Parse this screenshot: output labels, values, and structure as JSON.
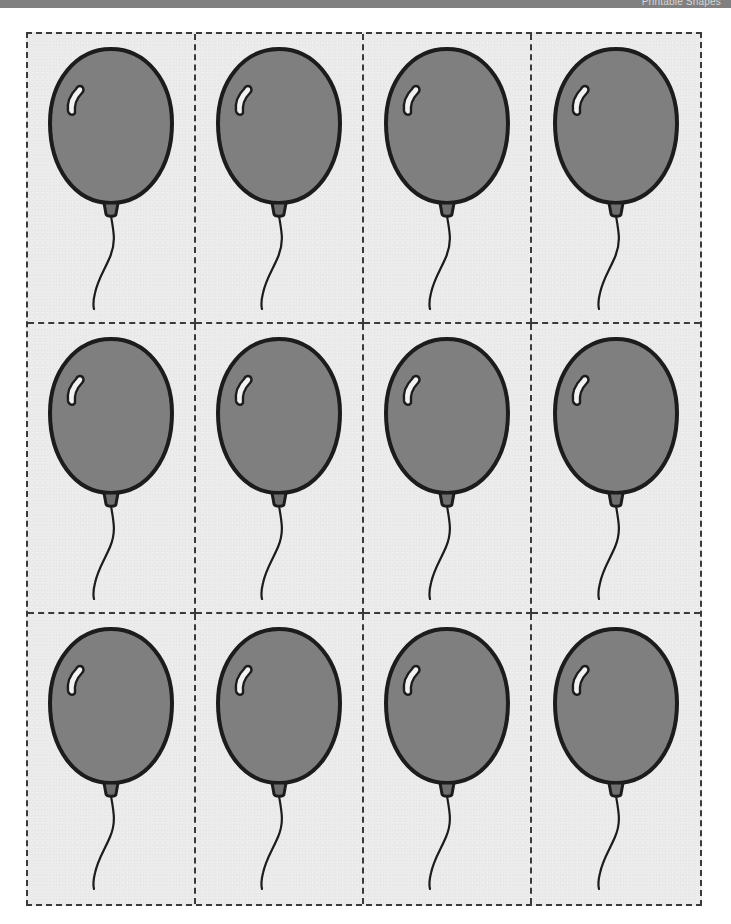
{
  "top_bar": {
    "title_fragment": "Printable Shapes",
    "bar_color": "#808080",
    "text_color": "#d8d8d8"
  },
  "page": {
    "background_color": "#ffffff",
    "sheet_background_color": "#ebebeb",
    "width_px": 731,
    "height_px": 924
  },
  "worksheet": {
    "name": "balloon-cutout-sheet",
    "grid": {
      "columns": 4,
      "rows": 3,
      "total_cells": 12,
      "cut_line_style": "dashed",
      "cut_line_color": "#3a3a3a",
      "cut_line_width_px": 2,
      "left_px": 26,
      "top_px": 32,
      "width_px": 676,
      "height_px": 874
    },
    "shape": {
      "name": "balloon",
      "fill_color": "#7f7f7f",
      "outline_color": "#1c1c1c",
      "highlight_color": "#f2f2f2",
      "string_color": "#1c1c1c",
      "knot_color": "#6f6f6f",
      "outline_width_px": 4
    },
    "cells": [
      {
        "index": 1,
        "row": 1,
        "column": 1,
        "shape": "balloon"
      },
      {
        "index": 2,
        "row": 1,
        "column": 2,
        "shape": "balloon"
      },
      {
        "index": 3,
        "row": 1,
        "column": 3,
        "shape": "balloon"
      },
      {
        "index": 4,
        "row": 1,
        "column": 4,
        "shape": "balloon"
      },
      {
        "index": 5,
        "row": 2,
        "column": 1,
        "shape": "balloon"
      },
      {
        "index": 6,
        "row": 2,
        "column": 2,
        "shape": "balloon"
      },
      {
        "index": 7,
        "row": 2,
        "column": 3,
        "shape": "balloon"
      },
      {
        "index": 8,
        "row": 2,
        "column": 4,
        "shape": "balloon"
      },
      {
        "index": 9,
        "row": 3,
        "column": 1,
        "shape": "balloon"
      },
      {
        "index": 10,
        "row": 3,
        "column": 2,
        "shape": "balloon"
      },
      {
        "index": 11,
        "row": 3,
        "column": 3,
        "shape": "balloon"
      },
      {
        "index": 12,
        "row": 3,
        "column": 4,
        "shape": "balloon"
      }
    ]
  }
}
